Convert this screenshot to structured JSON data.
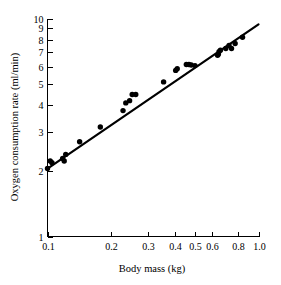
{
  "figure": {
    "background_color": "#ffffff",
    "ink_color": "#000000"
  },
  "chart_data": {
    "type": "scatter",
    "title": "",
    "subtitle": "",
    "xlabel": "Body mass (kg)",
    "ylabel": "Oxygen consumption rate (ml/min)",
    "xscale": "log",
    "yscale": "log",
    "xlim": [
      0.1,
      1.0
    ],
    "ylim": [
      1,
      10
    ],
    "grid": false,
    "legend": null,
    "legend_position": "none",
    "xticks": [
      0.1,
      0.2,
      0.3,
      0.4,
      0.5,
      0.6,
      0.8,
      1.0
    ],
    "xticklabels": [
      "0.1",
      "0.2",
      "0.3",
      "0.4",
      "0.5",
      "0.6",
      "0.8",
      "1.0"
    ],
    "yticks": [
      1,
      2,
      3,
      4,
      5,
      6,
      7,
      8,
      9,
      10
    ],
    "yticklabels": [
      "1",
      "2",
      "3",
      "4",
      "5",
      "6",
      "7",
      "8",
      "9",
      "10"
    ],
    "x": [
      0.1,
      0.103,
      0.105,
      0.118,
      0.12,
      0.122,
      0.142,
      0.178,
      0.228,
      0.235,
      0.245,
      0.252,
      0.262,
      0.355,
      0.405,
      0.412,
      0.455,
      0.468,
      0.48,
      0.5,
      0.64,
      0.645,
      0.65,
      0.66,
      0.7,
      0.725,
      0.745,
      0.775,
      0.84
    ],
    "y": [
      2.05,
      2.22,
      2.18,
      2.28,
      2.22,
      2.38,
      2.72,
      3.18,
      3.78,
      4.1,
      4.2,
      4.48,
      4.48,
      5.12,
      5.78,
      5.88,
      6.15,
      6.15,
      6.12,
      6.08,
      6.78,
      6.85,
      7.05,
      7.15,
      7.28,
      7.52,
      7.28,
      7.68,
      8.2
    ],
    "series": [
      {
        "name": "measurements",
        "marker": "filled-circle",
        "marker_color": "#000000",
        "marker_size_px": 4.2
      }
    ],
    "fit_line": {
      "name": "regression line",
      "type": "power-law",
      "x_start": 0.1,
      "y_start": 2.05,
      "x_end": 1.0,
      "y_end": 9.4,
      "slope_loglog": 0.66,
      "color": "#000000",
      "width_px": 2.2
    },
    "annotations": []
  }
}
